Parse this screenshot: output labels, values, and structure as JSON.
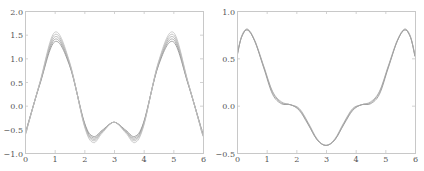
{
  "chart_data": [
    {
      "type": "line",
      "title": "",
      "xlabel": "",
      "ylabel": "",
      "xlim": [
        0,
        6
      ],
      "ylim": [
        -1.0,
        2.0
      ],
      "xticks": [
        "0",
        "1",
        "2",
        "3",
        "4",
        "5",
        "6"
      ],
      "yticks": [
        "-1.0",
        "-0.5",
        "0.0",
        "0.5",
        "1.0",
        "1.5",
        "2.0"
      ],
      "grid": false,
      "legend": null,
      "line_color": "#999999",
      "x": [
        0,
        0.5,
        1.0,
        1.5,
        2.0,
        2.3,
        2.6,
        3.0,
        3.4,
        3.7,
        4.0,
        4.5,
        5.0,
        5.5,
        6.0
      ],
      "series": [
        {
          "name": "curve-1",
          "values": [
            -0.6,
            0.45,
            1.35,
            0.85,
            -0.35,
            -0.65,
            -0.52,
            -0.35,
            -0.52,
            -0.65,
            -0.35,
            0.85,
            1.35,
            0.45,
            -0.6
          ]
        },
        {
          "name": "curve-2",
          "values": [
            -0.62,
            0.46,
            1.4,
            0.87,
            -0.37,
            -0.68,
            -0.54,
            -0.35,
            -0.54,
            -0.68,
            -0.37,
            0.87,
            1.4,
            0.46,
            -0.62
          ]
        },
        {
          "name": "curve-3",
          "values": [
            -0.63,
            0.47,
            1.45,
            0.89,
            -0.39,
            -0.71,
            -0.55,
            -0.35,
            -0.55,
            -0.71,
            -0.39,
            0.89,
            1.45,
            0.47,
            -0.63
          ]
        },
        {
          "name": "curve-4",
          "values": [
            -0.64,
            0.48,
            1.5,
            0.91,
            -0.41,
            -0.74,
            -0.56,
            -0.35,
            -0.56,
            -0.74,
            -0.41,
            0.91,
            1.5,
            0.48,
            -0.64
          ]
        },
        {
          "name": "curve-5",
          "values": [
            -0.65,
            0.49,
            1.55,
            0.93,
            -0.43,
            -0.78,
            -0.58,
            -0.35,
            -0.58,
            -0.78,
            -0.43,
            0.93,
            1.55,
            0.49,
            -0.65
          ]
        }
      ]
    },
    {
      "type": "line",
      "title": "",
      "xlabel": "",
      "ylabel": "",
      "xlim": [
        0,
        6
      ],
      "ylim": [
        -0.5,
        1.0
      ],
      "xticks": [
        "0",
        "1",
        "2",
        "3",
        "4",
        "5",
        "6"
      ],
      "yticks": [
        "-0.5",
        "0.0",
        "0.5",
        "1.0"
      ],
      "grid": false,
      "legend": null,
      "line_color": "#888888",
      "x": [
        0,
        0.15,
        0.35,
        0.6,
        0.9,
        1.2,
        1.5,
        1.8,
        2.1,
        2.4,
        2.7,
        3.0,
        3.3,
        3.6,
        3.9,
        4.2,
        4.5,
        4.8,
        5.1,
        5.4,
        5.65,
        5.85,
        6.0
      ],
      "series": [
        {
          "name": "curve-1",
          "values": [
            0.52,
            0.72,
            0.8,
            0.68,
            0.4,
            0.12,
            0.02,
            0.01,
            -0.05,
            -0.2,
            -0.36,
            -0.42,
            -0.36,
            -0.2,
            -0.05,
            0.01,
            0.02,
            0.12,
            0.4,
            0.68,
            0.8,
            0.72,
            0.52
          ]
        },
        {
          "name": "curve-2",
          "values": [
            0.52,
            0.72,
            0.8,
            0.68,
            0.41,
            0.14,
            0.03,
            0.01,
            -0.04,
            -0.19,
            -0.36,
            -0.42,
            -0.36,
            -0.19,
            -0.04,
            0.01,
            0.03,
            0.14,
            0.41,
            0.68,
            0.8,
            0.72,
            0.52
          ]
        },
        {
          "name": "curve-3",
          "values": [
            0.53,
            0.73,
            0.81,
            0.69,
            0.42,
            0.15,
            0.04,
            0.01,
            -0.03,
            -0.18,
            -0.35,
            -0.42,
            -0.35,
            -0.18,
            -0.03,
            0.01,
            0.04,
            0.15,
            0.42,
            0.69,
            0.81,
            0.73,
            0.53
          ]
        }
      ]
    }
  ],
  "panels": [
    {
      "name": "left-plot",
      "frame": {
        "x": 25,
        "y": 11,
        "w": 178,
        "h": 142
      }
    },
    {
      "name": "right-plot",
      "frame": {
        "x": 237,
        "y": 11,
        "w": 178,
        "h": 142
      }
    }
  ]
}
